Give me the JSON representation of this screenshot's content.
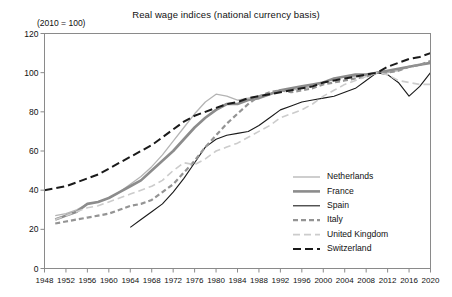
{
  "chart_data": {
    "type": "line",
    "title": "Real wage indices (national currency basis)",
    "subtitle": "(2010 = 100)",
    "xlabel": "",
    "ylabel": "",
    "grid": false,
    "legend_position": "bottom-right",
    "xlim": [
      1948,
      2020
    ],
    "ylim": [
      0,
      120
    ],
    "ytick_values": [
      0,
      20,
      40,
      60,
      80,
      100,
      120
    ],
    "ytick_labels": [
      "0",
      "20",
      "40",
      "60",
      "80",
      "100",
      "120"
    ],
    "xtick_values": [
      1948,
      1952,
      1956,
      1960,
      1964,
      1968,
      1972,
      1976,
      1980,
      1984,
      1988,
      1992,
      1996,
      2000,
      2004,
      2008,
      2012,
      2016,
      2020
    ],
    "xtick_labels": [
      "1948",
      "1952",
      "1956",
      "1960",
      "1964",
      "1968",
      "1972",
      "1976",
      "1980",
      "1984",
      "1988",
      "1992",
      "1996",
      "2000",
      "2004",
      "2008",
      "2012",
      "2016",
      "2020"
    ],
    "series": [
      {
        "name": "Netherlands",
        "color": "#b4b4b4",
        "width": 1.3,
        "dash": "none",
        "x": [
          1950,
          1952,
          1954,
          1956,
          1958,
          1960,
          1962,
          1964,
          1966,
          1968,
          1970,
          1972,
          1974,
          1976,
          1978,
          1980,
          1982,
          1984,
          1986,
          1988,
          1990,
          1992,
          1994,
          1996,
          1998,
          2000,
          2002,
          2004,
          2006,
          2008,
          2010,
          2012,
          2014,
          2016,
          2018,
          2020
        ],
        "values": [
          27,
          28,
          30,
          33,
          34,
          36,
          39,
          43,
          47,
          52,
          58,
          65,
          72,
          79,
          85,
          89,
          88,
          86,
          87,
          88,
          89,
          91,
          91,
          92,
          93,
          95,
          97,
          98,
          98,
          99,
          100,
          100,
          101,
          103,
          104,
          105
        ]
      },
      {
        "name": "France",
        "color": "#8c8c8c",
        "width": 2.6,
        "dash": "none",
        "x": [
          1950,
          1952,
          1954,
          1956,
          1958,
          1960,
          1962,
          1964,
          1966,
          1968,
          1970,
          1972,
          1974,
          1976,
          1978,
          1980,
          1982,
          1984,
          1986,
          1988,
          1990,
          1992,
          1994,
          1996,
          1998,
          2000,
          2002,
          2004,
          2006,
          2008,
          2010,
          2012,
          2014,
          2016,
          2018,
          2020
        ],
        "values": [
          25,
          27,
          29,
          33,
          34,
          36,
          39,
          42,
          45,
          50,
          55,
          60,
          66,
          72,
          77,
          81,
          84,
          84,
          86,
          87,
          89,
          91,
          92,
          93,
          94,
          95,
          97,
          98,
          99,
          99,
          100,
          101,
          102,
          103,
          104,
          105
        ]
      },
      {
        "name": "Spain",
        "color": "#1a1a1a",
        "width": 1.1,
        "dash": "none",
        "x": [
          1964,
          1966,
          1968,
          1970,
          1972,
          1974,
          1976,
          1978,
          1980,
          1982,
          1984,
          1986,
          1988,
          1990,
          1992,
          1994,
          1996,
          1998,
          2000,
          2002,
          2004,
          2006,
          2008,
          2010,
          2012,
          2014,
          2016,
          2018,
          2020
        ],
        "values": [
          21,
          25,
          29,
          33,
          39,
          46,
          54,
          62,
          66,
          68,
          69,
          70,
          73,
          77,
          81,
          83,
          85,
          86,
          87,
          88,
          90,
          92,
          96,
          100,
          99,
          95,
          88,
          93,
          100
        ]
      },
      {
        "name": "Italy",
        "color": "#949494",
        "width": 2.2,
        "dash": "5,3",
        "x": [
          1950,
          1952,
          1954,
          1956,
          1958,
          1960,
          1962,
          1964,
          1966,
          1968,
          1970,
          1972,
          1974,
          1976,
          1978,
          1980,
          1982,
          1984,
          1986,
          1988,
          1990,
          1992,
          1994,
          1996,
          1998,
          2000,
          2002,
          2004,
          2006,
          2008,
          2010,
          2012,
          2014,
          2016,
          2018,
          2020
        ],
        "values": [
          23,
          24,
          25,
          26,
          27,
          28,
          30,
          32,
          33,
          35,
          39,
          43,
          49,
          55,
          62,
          68,
          74,
          79,
          84,
          88,
          90,
          91,
          90,
          91,
          92,
          94,
          95,
          96,
          97,
          98,
          100,
          100,
          101,
          103,
          104,
          106
        ]
      },
      {
        "name": "United Kingdom",
        "color": "#cccccc",
        "width": 1.6,
        "dash": "7,4",
        "x": [
          1950,
          1952,
          1954,
          1956,
          1958,
          1960,
          1962,
          1964,
          1966,
          1968,
          1970,
          1972,
          1974,
          1976,
          1978,
          1980,
          1982,
          1984,
          1986,
          1988,
          1990,
          1992,
          1994,
          1996,
          1998,
          2000,
          2002,
          2004,
          2006,
          2008,
          2010,
          2012,
          2014,
          2016,
          2018,
          2020
        ],
        "values": [
          25,
          27,
          29,
          31,
          32,
          34,
          36,
          38,
          40,
          42,
          45,
          50,
          54,
          53,
          56,
          60,
          62,
          64,
          67,
          70,
          73,
          77,
          79,
          81,
          84,
          88,
          91,
          94,
          96,
          98,
          100,
          99,
          96,
          95,
          94,
          94
        ]
      },
      {
        "name": "Switzerland",
        "color": "#1a1a1a",
        "width": 2.0,
        "dash": "8,4",
        "x": [
          1948,
          1950,
          1952,
          1954,
          1956,
          1958,
          1960,
          1962,
          1964,
          1966,
          1968,
          1970,
          1972,
          1974,
          1976,
          1978,
          1980,
          1982,
          1984,
          1986,
          1988,
          1990,
          1992,
          1994,
          1996,
          1998,
          2000,
          2002,
          2004,
          2006,
          2008,
          2010,
          2012,
          2014,
          2016,
          2018,
          2020
        ],
        "values": [
          40,
          41,
          42,
          44,
          46,
          48,
          51,
          54,
          57,
          60,
          63,
          67,
          71,
          75,
          78,
          80,
          82,
          84,
          85,
          87,
          88,
          89,
          90,
          91,
          92,
          93,
          95,
          96,
          97,
          98,
          99,
          100,
          103,
          105,
          107,
          108,
          110
        ]
      }
    ]
  }
}
